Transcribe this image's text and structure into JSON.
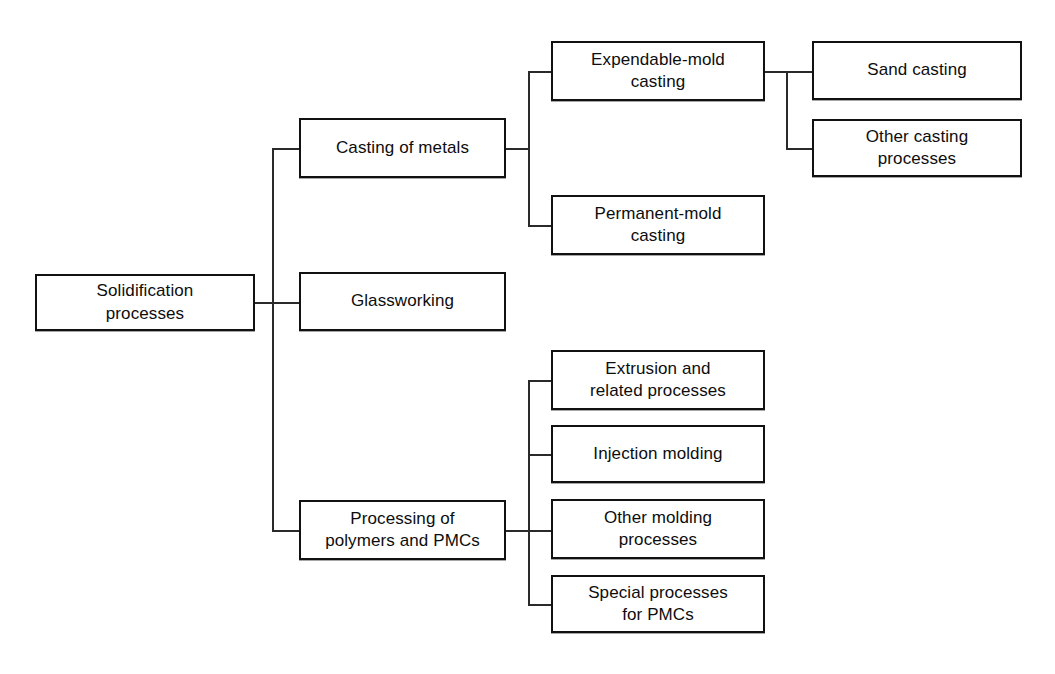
{
  "diagram": {
    "type": "tree-diagram",
    "background_color": "#ffffff",
    "line_color": "#2a2a2a",
    "box_border_color": "#111111",
    "box_fill_color": "#ffffff",
    "text_color": "#0d0d0d"
  },
  "nodes": {
    "root": {
      "label": "Solidification\nprocesses",
      "x": 35,
      "y": 274,
      "w": 220,
      "h": 57
    },
    "casting_of_metals": {
      "label": "Casting of metals",
      "x": 299,
      "y": 118,
      "w": 207,
      "h": 60
    },
    "glassworking": {
      "label": "Glassworking",
      "x": 299,
      "y": 272,
      "w": 207,
      "h": 59
    },
    "processing_polymers_pmcs": {
      "label": "Processing of\npolymers and PMCs",
      "x": 299,
      "y": 500,
      "w": 207,
      "h": 60
    },
    "expendable_mold_casting": {
      "label": "Expendable-mold\ncasting",
      "x": 551,
      "y": 41,
      "w": 214,
      "h": 60
    },
    "permanent_mold_casting": {
      "label": "Permanent-mold\ncasting",
      "x": 551,
      "y": 195,
      "w": 214,
      "h": 60
    },
    "sand_casting": {
      "label": "Sand casting",
      "x": 812,
      "y": 41,
      "w": 210,
      "h": 59
    },
    "other_casting_processes": {
      "label": "Other casting\nprocesses",
      "x": 812,
      "y": 119,
      "w": 210,
      "h": 58
    },
    "extrusion_and_related": {
      "label": "Extrusion and\nrelated processes",
      "x": 551,
      "y": 350,
      "w": 214,
      "h": 60
    },
    "injection_molding": {
      "label": "Injection molding",
      "x": 551,
      "y": 425,
      "w": 214,
      "h": 58
    },
    "other_molding_processes": {
      "label": "Other molding\nprocesses",
      "x": 551,
      "y": 499,
      "w": 214,
      "h": 60
    },
    "special_processes_pmcs": {
      "label": "Special processes\nfor PMCs",
      "x": 551,
      "y": 575,
      "w": 214,
      "h": 58
    }
  },
  "edges": {
    "root_stub": {
      "orient": "h",
      "x": 255,
      "y": 302,
      "len": 18
    },
    "level1_trunk": {
      "orient": "v",
      "x": 272,
      "y": 148,
      "len": 382
    },
    "level1_to_casting": {
      "orient": "h",
      "x": 272,
      "y": 148,
      "len": 28
    },
    "level1_to_glassworking": {
      "orient": "h",
      "x": 255,
      "y": 302,
      "len": 45
    },
    "level1_to_processing": {
      "orient": "h",
      "x": 272,
      "y": 530,
      "len": 28
    },
    "casting_stub": {
      "orient": "h",
      "x": 506,
      "y": 148,
      "len": 23
    },
    "casting_trunk": {
      "orient": "v",
      "x": 528,
      "y": 71,
      "len": 155
    },
    "casting_to_expendable": {
      "orient": "h",
      "x": 528,
      "y": 71,
      "len": 24
    },
    "casting_to_permanent": {
      "orient": "h",
      "x": 528,
      "y": 225,
      "len": 24
    },
    "expendable_stub": {
      "orient": "h",
      "x": 765,
      "y": 71,
      "len": 22
    },
    "expendable_trunk": {
      "orient": "v",
      "x": 786,
      "y": 71,
      "len": 78
    },
    "expendable_to_sand": {
      "orient": "h",
      "x": 786,
      "y": 71,
      "len": 27
    },
    "expendable_to_other": {
      "orient": "h",
      "x": 786,
      "y": 148,
      "len": 27
    },
    "processing_stub": {
      "orient": "h",
      "x": 506,
      "y": 530,
      "len": 23
    },
    "processing_trunk": {
      "orient": "v",
      "x": 528,
      "y": 380,
      "len": 225
    },
    "processing_to_extrusion": {
      "orient": "h",
      "x": 528,
      "y": 380,
      "len": 24
    },
    "processing_to_injection": {
      "orient": "h",
      "x": 528,
      "y": 454,
      "len": 24
    },
    "processing_to_othermolding": {
      "orient": "h",
      "x": 528,
      "y": 530,
      "len": 24
    },
    "processing_to_special": {
      "orient": "h",
      "x": 528,
      "y": 604,
      "len": 24
    }
  },
  "hierarchy": {
    "root": "Solidification processes",
    "children": [
      {
        "name": "Casting of metals",
        "children": [
          {
            "name": "Expendable-mold casting",
            "children": [
              {
                "name": "Sand casting"
              },
              {
                "name": "Other casting processes"
              }
            ]
          },
          {
            "name": "Permanent-mold casting"
          }
        ]
      },
      {
        "name": "Glassworking"
      },
      {
        "name": "Processing of polymers and PMCs",
        "children": [
          {
            "name": "Extrusion and related processes"
          },
          {
            "name": "Injection molding"
          },
          {
            "name": "Other molding processes"
          },
          {
            "name": "Special processes for PMCs"
          }
        ]
      }
    ]
  }
}
